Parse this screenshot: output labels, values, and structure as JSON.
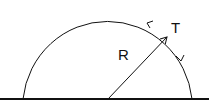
{
  "diagram": {
    "type": "semicircle-radius-tangent",
    "labels": {
      "radius": "R",
      "tangent": "T"
    },
    "colors": {
      "stroke": "#111111",
      "background": "#ffffff"
    }
  }
}
